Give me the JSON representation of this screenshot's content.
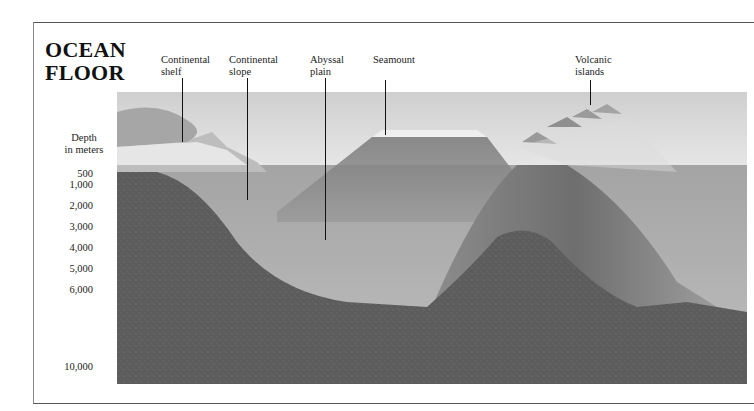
{
  "title": {
    "line1": "OCEAN",
    "line2": "FLOOR"
  },
  "labels": [
    {
      "id": "continental-shelf",
      "line1": "Continental",
      "line2": "shelf",
      "x": 161,
      "y": 54,
      "leader_x": 182,
      "leader_y1": 78,
      "leader_y2": 142
    },
    {
      "id": "continental-slope",
      "line1": "Continental",
      "line2": "slope",
      "x": 229,
      "y": 54,
      "leader_x": 247,
      "leader_y1": 78,
      "leader_y2": 200
    },
    {
      "id": "abyssal-plain",
      "line1": "Abyssal",
      "line2": "plain",
      "x": 310,
      "y": 54,
      "leader_x": 325,
      "leader_y1": 78,
      "leader_y2": 240
    },
    {
      "id": "seamount",
      "line1": "Seamount",
      "line2": "",
      "x": 373,
      "y": 54,
      "leader_x": 385,
      "leader_y1": 80,
      "leader_y2": 135
    },
    {
      "id": "volcanic-islands",
      "line1": "Volcanic",
      "line2": "islands",
      "x": 575,
      "y": 54,
      "leader_x": 590,
      "leader_y1": 80,
      "leader_y2": 105
    }
  ],
  "depth_axis": {
    "title_line1": "Depth",
    "title_line2": "in meters",
    "ticks": [
      {
        "label": "500",
        "y": 175
      },
      {
        "label": "1,000",
        "y": 186
      },
      {
        "label": "2,000",
        "y": 207
      },
      {
        "label": "3,000",
        "y": 228
      },
      {
        "label": "4,000",
        "y": 249
      },
      {
        "label": "5,000",
        "y": 270
      },
      {
        "label": "6,000",
        "y": 291
      },
      {
        "label": "10,000",
        "y": 368
      }
    ]
  },
  "colors": {
    "surface_water": "#d9d9d9",
    "deep_water": "#a9a9a9",
    "crust": "#5e5e5e",
    "mountain": "#8a8a8a",
    "frame": "#555555"
  }
}
